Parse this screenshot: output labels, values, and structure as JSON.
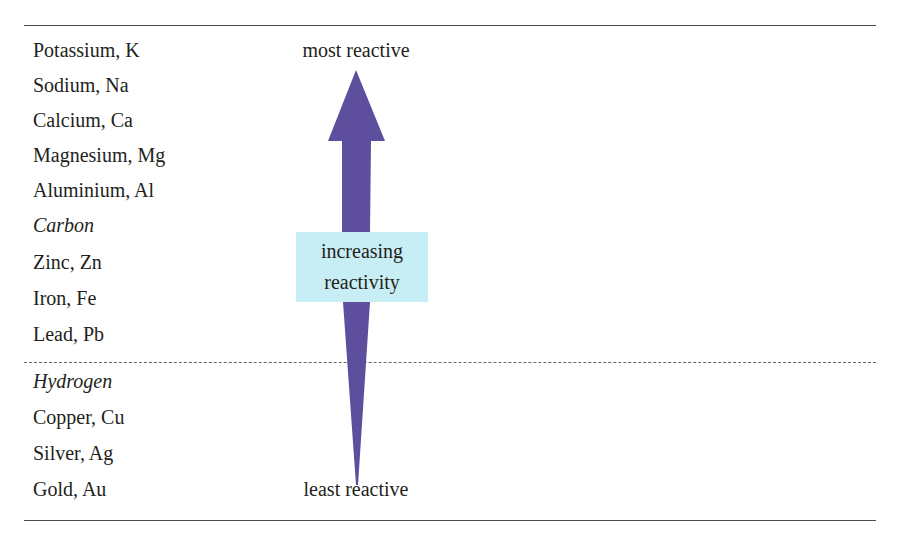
{
  "diagram": {
    "top_label": "most reactive",
    "bottom_label": "least reactive",
    "arrow_label_line1": "increasing",
    "arrow_label_line2": "reactivity",
    "arrow_direction": "up",
    "colors": {
      "arrow": "#5e4f9e",
      "label_box": "#c8eef5",
      "rule": "#4a4a4a",
      "text": "#231f20"
    },
    "elements_above_hydrogen": [
      {
        "label": "Potassium, K",
        "italic": false
      },
      {
        "label": "Sodium, Na",
        "italic": false
      },
      {
        "label": "Calcium, Ca",
        "italic": false
      },
      {
        "label": "Magnesium, Mg",
        "italic": false
      },
      {
        "label": "Aluminium, Al",
        "italic": false
      },
      {
        "label": "Carbon",
        "italic": true
      },
      {
        "label": "Zinc, Zn",
        "italic": false
      },
      {
        "label": "Iron, Fe",
        "italic": false
      },
      {
        "label": "Lead, Pb",
        "italic": false
      }
    ],
    "elements_below_hydrogen": [
      {
        "label": "Hydrogen",
        "italic": true
      },
      {
        "label": "Copper, Cu",
        "italic": false
      },
      {
        "label": "Silver, Ag",
        "italic": false
      },
      {
        "label": "Gold, Au",
        "italic": false
      }
    ]
  }
}
